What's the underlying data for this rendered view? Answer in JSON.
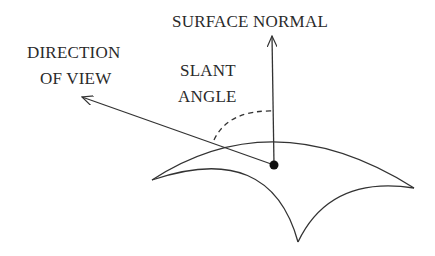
{
  "diagram": {
    "labels": {
      "surface_normal": "SURFACE NORMAL",
      "direction_of_view_line1": "DIRECTION",
      "direction_of_view_line2": "OF VIEW",
      "slant_angle_line1": "SLANT",
      "slant_angle_line2": "ANGLE"
    },
    "elements": {
      "surface_point": "surface-point-dot",
      "surface_normal_arrow": "vertical arrow from surface point upward",
      "view_direction_arrow": "arrow from surface point toward upper-left",
      "slant_angle_arc": "dashed arc between view direction and surface normal",
      "surface_patch": "curved triangular surface patch"
    },
    "colors": {
      "stroke": "#333333",
      "text": "#2a2a2a",
      "background": "#ffffff"
    }
  }
}
